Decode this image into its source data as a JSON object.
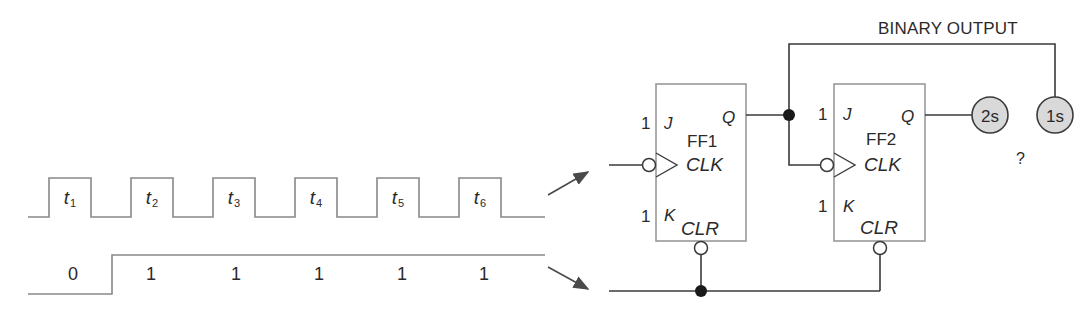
{
  "diagram": {
    "title": "BINARY OUTPUT",
    "question_mark": "?",
    "clock_waveform": {
      "pulses": [
        {
          "label": "t",
          "sub": "1"
        },
        {
          "label": "t",
          "sub": "2"
        },
        {
          "label": "t",
          "sub": "3"
        },
        {
          "label": "t",
          "sub": "4"
        },
        {
          "label": "t",
          "sub": "5"
        },
        {
          "label": "t",
          "sub": "6"
        }
      ]
    },
    "clear_waveform": {
      "values": [
        "0",
        "1",
        "1",
        "1",
        "1",
        "1"
      ]
    },
    "flip_flops": [
      {
        "name": "FF1",
        "j_input": "1",
        "k_input": "1",
        "pin_j": "J",
        "pin_k": "K",
        "pin_q": "Q",
        "pin_clk": "CLK",
        "pin_clr": "CLR"
      },
      {
        "name": "FF2",
        "j_input": "1",
        "k_input": "1",
        "pin_j": "J",
        "pin_k": "K",
        "pin_q": "Q",
        "pin_clk": "CLK",
        "pin_clr": "CLR"
      }
    ],
    "outputs": [
      {
        "label": "2s"
      },
      {
        "label": "1s"
      }
    ],
    "colors": {
      "line": "#3a3a3a",
      "box": "#8a8a8a",
      "output_fill": "#d9d9d9",
      "arrow": "#4a4a4a"
    }
  }
}
